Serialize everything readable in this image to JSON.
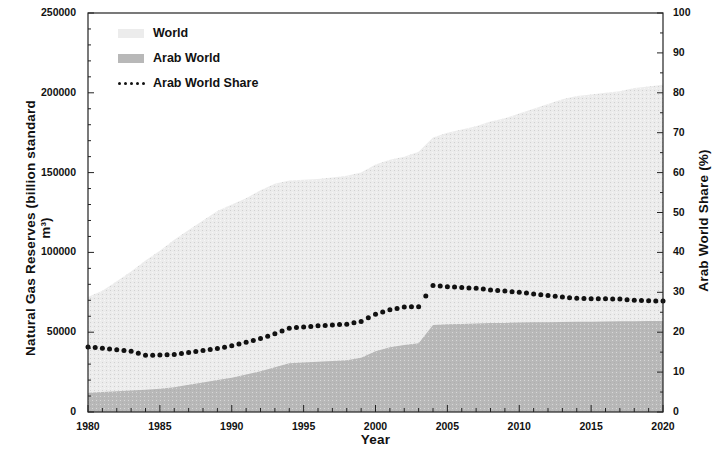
{
  "chart_data": {
    "type": "area",
    "title": "",
    "xlabel": "Year",
    "ylabel": "Natural Gas Reserves (billion standard m³)",
    "y2label": "Arab World Share (%)",
    "xlim": [
      1980,
      2020
    ],
    "ylim": [
      0,
      250000
    ],
    "y2lim": [
      0,
      100
    ],
    "grid": false,
    "legend_position": "top-left inside",
    "xticks": [
      1980,
      1985,
      1990,
      1995,
      2000,
      2005,
      2010,
      2015,
      2020
    ],
    "xtick_labels": [
      "1980",
      "1985",
      "1990",
      "1995",
      "2000",
      "2005",
      "2010",
      "2015",
      "2020"
    ],
    "x_minor_tick_interval": 1,
    "yticks": [
      0,
      50000,
      100000,
      150000,
      200000,
      250000
    ],
    "ytick_labels": [
      "0",
      "50000",
      "100000",
      "150000",
      "200000",
      "250000"
    ],
    "y2ticks": [
      0,
      10,
      20,
      30,
      40,
      50,
      60,
      70,
      80,
      90,
      100
    ],
    "y2tick_labels": [
      "0",
      "10",
      "20",
      "30",
      "40",
      "50",
      "60",
      "70",
      "80",
      "90",
      "100"
    ],
    "x": [
      1980,
      1981,
      1982,
      1983,
      1984,
      1985,
      1986,
      1987,
      1988,
      1989,
      1990,
      1991,
      1992,
      1993,
      1994,
      1995,
      1996,
      1997,
      1998,
      1999,
      2000,
      2001,
      2002,
      2003,
      2004,
      2005,
      2006,
      2007,
      2008,
      2009,
      2010,
      2011,
      2012,
      2013,
      2014,
      2015,
      2016,
      2017,
      2018,
      2019,
      2020
    ],
    "series": [
      {
        "name": "World",
        "axis": "left",
        "units": "billion standard m³",
        "fill": "#ececec",
        "values": [
          72000,
          76000,
          82000,
          88000,
          95000,
          101000,
          108000,
          114000,
          120000,
          126000,
          130000,
          134000,
          139000,
          143000,
          145000,
          145500,
          146000,
          147000,
          148000,
          150000,
          155000,
          158000,
          160000,
          163000,
          172000,
          175000,
          177000,
          179000,
          182000,
          184000,
          187000,
          190000,
          193000,
          196000,
          198000,
          199000,
          200000,
          201000,
          203000,
          204000,
          205000
        ]
      },
      {
        "name": "Arab World",
        "axis": "left",
        "units": "billion standard m³",
        "fill": "#b8b8b8",
        "values": [
          12000,
          12500,
          13000,
          13500,
          14000,
          14500,
          15500,
          17000,
          18500,
          20000,
          21500,
          23500,
          25500,
          28000,
          30500,
          31000,
          31500,
          32000,
          32500,
          34000,
          38000,
          40500,
          42000,
          43000,
          54500,
          55000,
          55200,
          55500,
          55700,
          55800,
          56000,
          56200,
          56300,
          56400,
          56500,
          56600,
          56700,
          56800,
          56900,
          57000,
          57000
        ]
      },
      {
        "name": "Arab World Share",
        "axis": "right",
        "units": "%",
        "style": "dotted",
        "color": "#111111",
        "values": [
          16.3,
          16.0,
          15.6,
          15.2,
          14.2,
          14.3,
          14.4,
          14.9,
          15.4,
          15.9,
          16.6,
          17.5,
          18.4,
          19.6,
          21.0,
          21.3,
          21.6,
          21.8,
          22.0,
          22.7,
          24.5,
          25.6,
          26.3,
          26.4,
          31.7,
          31.4,
          31.2,
          31.0,
          30.6,
          30.3,
          30.0,
          29.6,
          29.2,
          28.8,
          28.5,
          28.4,
          28.4,
          28.3,
          28.0,
          27.9,
          27.8
        ]
      }
    ]
  },
  "legend": {
    "items": [
      {
        "label": "World",
        "marker": "swatch",
        "color": "#ececec"
      },
      {
        "label": "Arab World",
        "marker": "swatch",
        "color": "#b8b8b8"
      },
      {
        "label": "Arab World Share",
        "marker": "dots",
        "color": "#111111"
      }
    ]
  }
}
